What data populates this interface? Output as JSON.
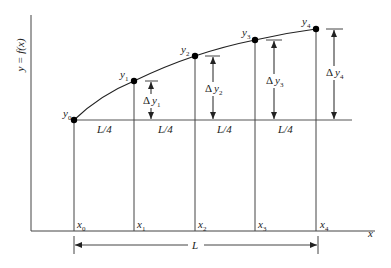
{
  "diagram": {
    "axes": {
      "y_label": "y = f(x)",
      "x_label": "x"
    },
    "points": [
      {
        "y_label": "y",
        "y_sub": "0",
        "x_label": "x",
        "x_sub": "0"
      },
      {
        "y_label": "y",
        "y_sub": "1",
        "x_label": "x",
        "x_sub": "1"
      },
      {
        "y_label": "y",
        "y_sub": "2",
        "x_label": "x",
        "x_sub": "2"
      },
      {
        "y_label": "y",
        "y_sub": "3",
        "x_label": "x",
        "x_sub": "3"
      },
      {
        "y_label": "y",
        "y_sub": "4",
        "x_label": "x",
        "x_sub": "4"
      }
    ],
    "segment_labels": [
      "L/4",
      "L/4",
      "L/4",
      "L/4"
    ],
    "deltas": [
      {
        "prefix": "Δ",
        "var": "y",
        "sub": "1"
      },
      {
        "prefix": "Δ",
        "var": "y",
        "sub": "2"
      },
      {
        "prefix": "Δ",
        "var": "y",
        "sub": "3"
      },
      {
        "prefix": "Δ",
        "var": "y",
        "sub": "4"
      }
    ],
    "total_length_label": "L",
    "colors": {
      "line": "#333333",
      "point": "#000000",
      "background": "#ffffff"
    }
  }
}
